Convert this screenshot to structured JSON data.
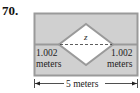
{
  "problem": {
    "number": "70."
  },
  "figure": {
    "center_label": "z",
    "left_label_line1": "1.002",
    "left_label_line2": "meters",
    "right_label_line1": "1.002",
    "right_label_line2": "meters",
    "dimension_label": "5 meters",
    "colors": {
      "fill": "#cfcfcf",
      "border": "#9a9a9a",
      "diamond": "#ffffff"
    }
  }
}
